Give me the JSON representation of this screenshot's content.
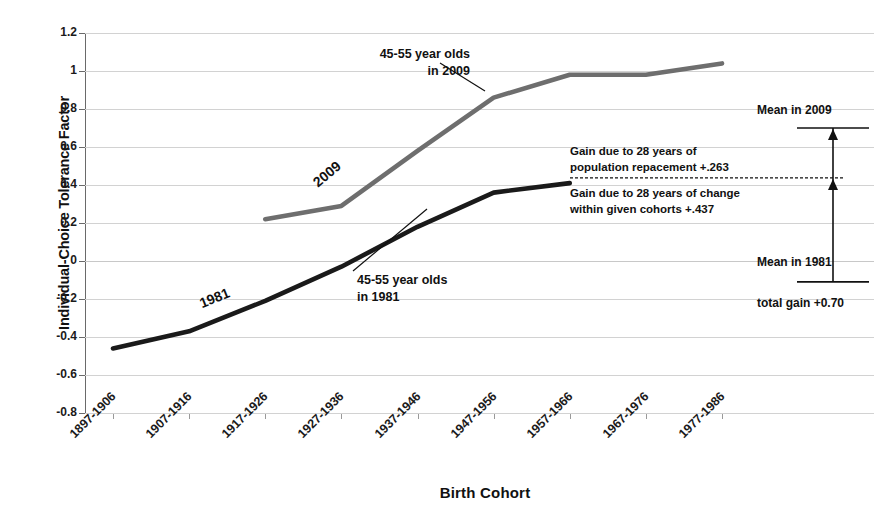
{
  "chart_data": {
    "type": "line",
    "title": "",
    "xlabel": "Birth Cohort",
    "ylabel": "Individual-Choice Tolerance Factor",
    "ylim": [
      -0.8,
      1.2
    ],
    "ytick_step": 0.2,
    "yticks": [
      "1.2",
      "1",
      "0.8",
      "0.6",
      "0.4",
      "0.2",
      "0",
      "-0.2",
      "-0.4",
      "-0.6",
      "-0.8"
    ],
    "grid": true,
    "legend_position": "inline-labels",
    "categories": [
      "1897-1906",
      "1907-1916",
      "1917-1926",
      "1927-1936",
      "1937-1946",
      "1947-1956",
      "1957-1966",
      "1967-1976",
      "1977-1986"
    ],
    "series": [
      {
        "name": "1981",
        "color": "#1a1a1a",
        "inline_label": "1981",
        "callout": "45-55 year olds\nin 1981",
        "values": [
          -0.46,
          -0.37,
          -0.21,
          -0.03,
          0.18,
          0.36,
          0.41,
          null,
          null
        ]
      },
      {
        "name": "2009",
        "color": "#6e6e6e",
        "inline_label": "2009",
        "callout": "45-55 year olds\nin 2009",
        "values": [
          null,
          null,
          0.22,
          0.29,
          0.58,
          0.86,
          0.98,
          0.98,
          1.04
        ]
      }
    ],
    "annotations": {
      "mean_2009_label": "Mean in 2009",
      "mean_1981_label": "Mean in 1981",
      "gain_population_replacement": "Gain due to 28 years of\npopulation repacement  +.263",
      "gain_within_cohorts": "Gain due to 28 years of change\nwithin given cohorts  +.437",
      "total_gain": "total gain +0.70",
      "mean_2009_value": 0.7,
      "mean_1981_value": 0.0,
      "split_value": 0.437,
      "population_replacement_value": 0.263,
      "within_cohort_value": 0.437,
      "total_gain_value": 0.7
    }
  },
  "series_callouts": {
    "black_line_1": "45-55 year olds",
    "black_line_2": "in 1981",
    "gray_line_1": "45-55 year olds",
    "gray_line_2": "in 2009"
  },
  "annotation_lines": {
    "gain_pop_1": "Gain due to 28 years of",
    "gain_pop_2": "population repacement  +.263",
    "gain_coh_1": "Gain due to 28 years of change",
    "gain_coh_2": "within given cohorts  +.437"
  },
  "colors": {
    "line_1981": "#1a1a1a",
    "line_2009": "#6e6e6e",
    "grid": "#d2d2d2",
    "axis": "#6a6a6a",
    "text": "#111111",
    "background": "#ffffff"
  }
}
